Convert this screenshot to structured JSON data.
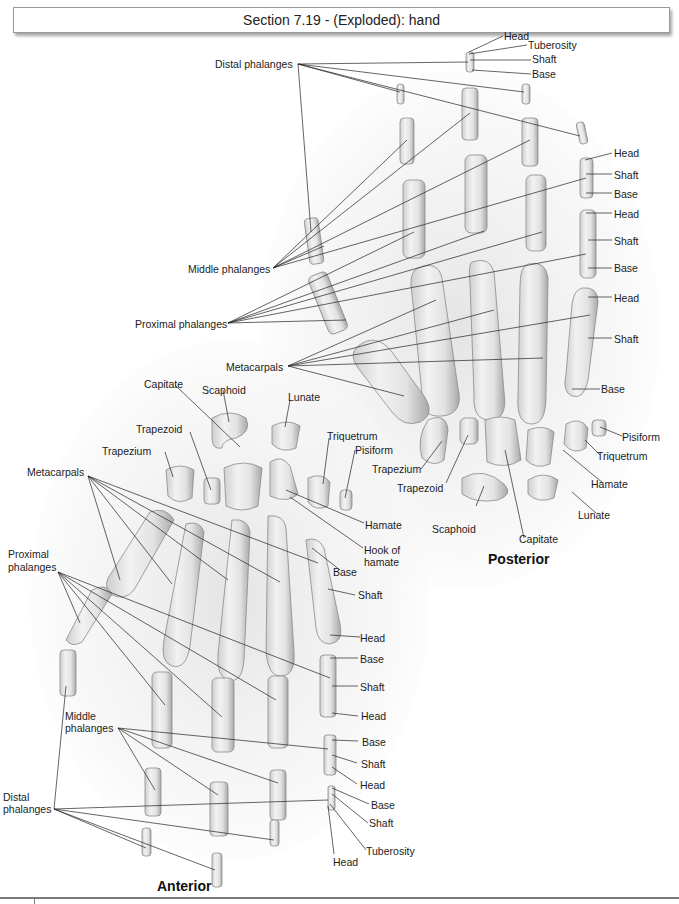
{
  "title": "Section 7.19 - (Exploded): hand",
  "views": {
    "posterior": "Posterior",
    "anterior": "Anterior"
  },
  "posterior_labels": {
    "distal_phalanges": "Distal phalanges",
    "middle_phalanges": "Middle phalanges",
    "proximal_phalanges": "Proximal phalanges",
    "metacarpals": "Metacarpals",
    "distal_head": "Head",
    "distal_tuberosity": "Tuberosity",
    "distal_shaft": "Shaft",
    "distal_base": "Base",
    "middle_head": "Head",
    "middle_shaft": "Shaft",
    "middle_base": "Base",
    "proximal_head": "Head",
    "proximal_shaft": "Shaft",
    "proximal_base": "Base",
    "meta_head": "Head",
    "meta_shaft": "Shaft",
    "meta_base": "Base",
    "pisiform": "Pisiform",
    "triquetrum": "Triquetrum",
    "hamate": "Hamate",
    "lunate": "Lunate",
    "capitate": "Capitate",
    "scaphoid": "Scaphoid",
    "trapezoid": "Trapezoid",
    "trapezium": "Trapezium"
  },
  "anterior_labels": {
    "capitate": "Capitate",
    "scaphoid": "Scaphoid",
    "lunate": "Lunate",
    "trapezoid": "Trapezoid",
    "triquetrum": "Triquetrum",
    "trapezium": "Trapezium",
    "pisiform": "Pisiform",
    "metacarpals": "Metacarpals",
    "hamate": "Hamate",
    "hook_of_hamate_1": "Hook of",
    "hook_of_hamate_2": "hamate",
    "meta_base": "Base",
    "meta_shaft": "Shaft",
    "meta_head": "Head",
    "proximal_phalanges_1": "Proximal",
    "proximal_phalanges_2": "phalanges",
    "proximal_base": "Base",
    "proximal_shaft": "Shaft",
    "proximal_head": "Head",
    "middle_phalanges_1": "Middle",
    "middle_phalanges_2": "phalanges",
    "middle_base": "Base",
    "middle_shaft": "Shaft",
    "middle_head": "Head",
    "distal_phalanges_1": "Distal",
    "distal_phalanges_2": "phalanges",
    "distal_base": "Base",
    "distal_shaft": "Shaft",
    "distal_tuberosity": "Tuberosity",
    "distal_head": "Head"
  }
}
